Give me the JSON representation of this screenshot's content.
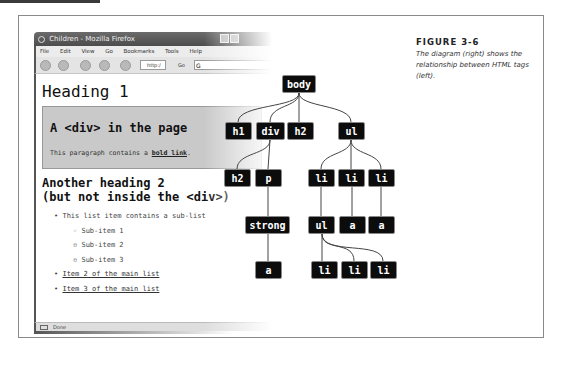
{
  "browser": {
    "window_title": "Children - Mozilla Firefox",
    "menu": [
      "File",
      "Edit",
      "View",
      "Go",
      "Bookmarks",
      "Tools",
      "Help"
    ],
    "url_partial": "http:/",
    "go_label": "Go",
    "status_text": "Done"
  },
  "page": {
    "heading1": "Heading 1",
    "div_heading": "A <div> in the page",
    "div_paragraph_prefix": "This paragraph contains a ",
    "div_paragraph_link": "bold link",
    "div_paragraph_suffix": ".",
    "heading2_line1": "Another heading 2",
    "heading2_line2": "(but not inside the <div>)",
    "list": {
      "item1": "This list item contains a sub-list",
      "sub_items": [
        "Sub-item 1",
        "Sub-item 2",
        "Sub-item 3"
      ],
      "item2": "Item 2 of the main list",
      "item3": "Item 3 of the main list"
    }
  },
  "tree": {
    "nodes": {
      "body": "body",
      "h1": "h1",
      "div": "div",
      "h2a": "h2",
      "ul": "ul",
      "h2b": "h2",
      "p": "p",
      "li1": "li",
      "li2": "li",
      "li3": "li",
      "strong": "strong",
      "ul2": "ul",
      "a2": "a",
      "a3": "a",
      "a1": "a",
      "sli1": "li",
      "sli2": "li",
      "sli3": "li"
    }
  },
  "caption": {
    "title": "FIGURE 3-6",
    "text": "The diagram (right) shows the relationship between HTML tags (left)."
  }
}
